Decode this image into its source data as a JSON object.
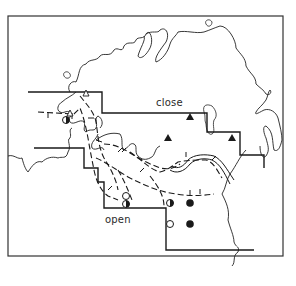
{
  "map": {
    "labels": {
      "close": "close",
      "open": "open"
    },
    "colors": {
      "ink": "#1a1a1a",
      "frame": "#333333",
      "background": "#ffffff"
    },
    "legend_symbols": {
      "open_triangle": "open-triangle-marker",
      "filled_triangle": "filled-triangle-marker",
      "open_circle": "open-circle-marker",
      "filled_circle": "filled-circle-marker",
      "half_circle": "half-filled-circle-marker"
    },
    "lines": {
      "coastline": "solid thin",
      "boundary": "solid stepped",
      "isoline": "dashed with ticks"
    }
  }
}
